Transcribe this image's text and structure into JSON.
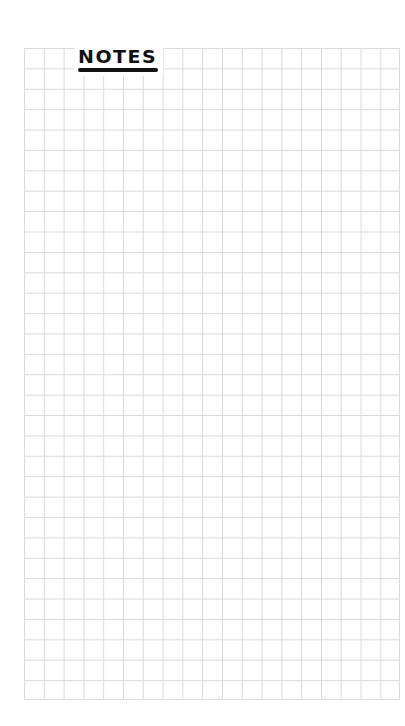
{
  "page": {
    "type": "grid-notes-page",
    "background_color": "#ffffff",
    "grid_line_color": "#dadada",
    "grid": {
      "columns": 19,
      "rows": 32,
      "cell_width_px": 19.8,
      "cell_height_px": 20.4
    }
  },
  "header": {
    "title": "NOTES",
    "title_color": "#111111",
    "underline_color": "#111111"
  }
}
